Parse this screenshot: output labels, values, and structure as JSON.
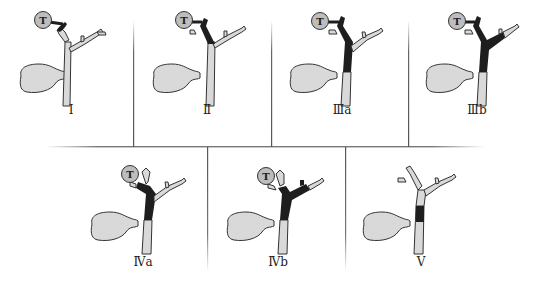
{
  "figure": {
    "tumor_marker": "T",
    "colors": {
      "duct_fill": "#d9d9d9",
      "tumor_fill": "#1e1e1e",
      "outline": "#333333",
      "tumor_circle": "#bdbdbd",
      "grid_line": "#6a6a6a"
    },
    "panels": [
      {
        "id": "I",
        "label": "Ⅰ",
        "has_tumor_marker": true,
        "tumor_segment": "confluence-below"
      },
      {
        "id": "II",
        "label": "Ⅱ",
        "has_tumor_marker": true,
        "tumor_segment": "confluence"
      },
      {
        "id": "IIIa",
        "label": "Ⅲa",
        "has_tumor_marker": true,
        "tumor_segment": "confluence+right"
      },
      {
        "id": "IIIb",
        "label": "Ⅲb",
        "has_tumor_marker": true,
        "tumor_segment": "confluence+left"
      },
      {
        "id": "IVa",
        "label": "Ⅳa",
        "has_tumor_marker": true,
        "tumor_segment": "both-partial-right"
      },
      {
        "id": "IVb",
        "label": "Ⅳb",
        "has_tumor_marker": true,
        "tumor_segment": "both-partial-left"
      },
      {
        "id": "V",
        "label": "Ⅴ",
        "has_tumor_marker": false,
        "tumor_segment": "mid-common-duct"
      }
    ]
  }
}
